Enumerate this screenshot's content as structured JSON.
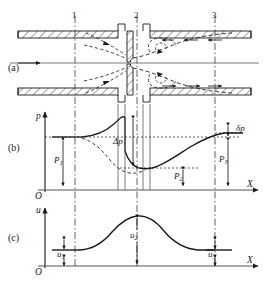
{
  "figure": {
    "type": "orifice-plate-flow-diagram",
    "panels": [
      {
        "id": "a",
        "label": "(a)",
        "caption": "pipe with orifice plate, jet contraction and recirculation vortices"
      },
      {
        "id": "b",
        "label": "(b)",
        "caption": "static pressure distribution along pipe axis"
      },
      {
        "id": "c",
        "label": "(c)",
        "caption": "mean velocity distribution along pipe axis"
      }
    ],
    "sections": [
      {
        "name": "1",
        "x": 75
      },
      {
        "name": "2",
        "x": 137
      },
      {
        "name": "3",
        "x": 215
      }
    ]
  },
  "panel_a": {
    "flow_arrow": "→",
    "wall_hatching": "diagonal",
    "orifice_label": "orifice-plate"
  },
  "panel_b": {
    "y_axis_label": "p",
    "x_axis_label": "X",
    "origin_label": "O",
    "annotations": [
      {
        "name": "P1",
        "text": "P",
        "sub": "1"
      },
      {
        "name": "P2",
        "text": "P",
        "sub": "2"
      },
      {
        "name": "P3",
        "text": "P",
        "sub": "3"
      },
      {
        "name": "delta-p",
        "text": "Δp"
      },
      {
        "name": "permanent-loss",
        "text": "δp"
      }
    ]
  },
  "panel_c": {
    "y_axis_label": "u",
    "x_axis_label": "X",
    "origin_label": "O",
    "annotations": [
      {
        "name": "u1",
        "text": "u",
        "sub": "1"
      },
      {
        "name": "u2",
        "text": "u",
        "sub": "2"
      },
      {
        "name": "u3",
        "text": "u",
        "sub": "3"
      }
    ]
  },
  "colors": {
    "line": "#1a1a1a",
    "background": "#ffffff",
    "axis": "#555555"
  }
}
